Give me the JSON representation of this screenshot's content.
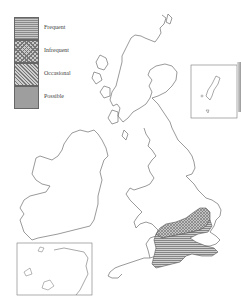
{
  "legend": {
    "items": [
      {
        "label": "Frequent",
        "pattern": "horizontal-lines"
      },
      {
        "label": "Infrequent",
        "pattern": "crosshatch"
      },
      {
        "label": "Occasional",
        "pattern": "diagonal-hatch"
      },
      {
        "label": "Possible",
        "pattern": "stipple"
      }
    ]
  },
  "map": {
    "subject": "Britain and Ireland",
    "insets": [
      "shetland-inset",
      "channel-inset"
    ],
    "shaded_region": {
      "location": "south-east England",
      "patterns": [
        "Infrequent",
        "Frequent"
      ]
    },
    "colors": {
      "outline": "#6e6e6e",
      "fill_dark": "#8a8a8a",
      "fill_light": "#c8c8c8"
    }
  }
}
